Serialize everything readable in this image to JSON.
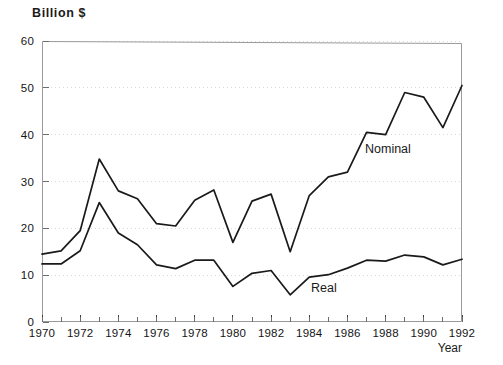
{
  "chart_data": {
    "type": "line",
    "title": "",
    "ylabel": "Billion $",
    "xlabel": "Year",
    "ylim": [
      0,
      60
    ],
    "xlim": [
      1970,
      1992
    ],
    "yticks": [
      0,
      10,
      20,
      30,
      40,
      50,
      60
    ],
    "xticks": [
      1970,
      1972,
      1974,
      1976,
      1978,
      1980,
      1982,
      1984,
      1986,
      1988,
      1990,
      1992
    ],
    "xtick_minor_step": 1,
    "grid": "dotted-horizontal",
    "legend_position": "inline-annotations",
    "x": [
      1970,
      1971,
      1972,
      1973,
      1974,
      1975,
      1976,
      1977,
      1978,
      1979,
      1980,
      1981,
      1982,
      1983,
      1984,
      1985,
      1986,
      1987,
      1988,
      1989,
      1990,
      1991,
      1992
    ],
    "series": [
      {
        "name": "Nominal",
        "values": [
          14.5,
          15.2,
          19.5,
          34.8,
          28.0,
          26.3,
          21.0,
          20.5,
          26.0,
          28.2,
          17.0,
          25.8,
          27.3,
          15.0,
          27.0,
          31.0,
          32.0,
          40.5,
          40.0,
          49.0,
          48.0,
          41.5,
          50.5
        ]
      },
      {
        "name": "Real",
        "values": [
          12.4,
          12.4,
          15.2,
          25.5,
          19.0,
          16.5,
          12.2,
          11.4,
          13.2,
          13.2,
          7.6,
          10.4,
          11.0,
          5.8,
          9.6,
          10.1,
          11.5,
          13.2,
          13.0,
          14.3,
          13.9,
          12.2,
          13.4
        ]
      }
    ],
    "annotations": [
      {
        "text": "Nominal",
        "x": 1987.5,
        "y": 35.5
      },
      {
        "text": "Real",
        "x": 1984.3,
        "y": 6.0
      }
    ]
  },
  "axis": {
    "y_title": "Billion $",
    "x_title": "Year",
    "y_tick_labels": [
      "0",
      "10",
      "20",
      "30",
      "40",
      "50",
      "60"
    ],
    "x_tick_labels": [
      "1970",
      "1972",
      "1974",
      "1976",
      "1978",
      "1980",
      "1982",
      "1984",
      "1986",
      "1988",
      "1990",
      "1992"
    ]
  },
  "labels": {
    "nominal": "Nominal",
    "real": "Real"
  },
  "colors": {
    "line": "#1a1a1a",
    "border": "#9a9a9a",
    "grid": "#d8d8d8",
    "background": "#ffffff"
  }
}
